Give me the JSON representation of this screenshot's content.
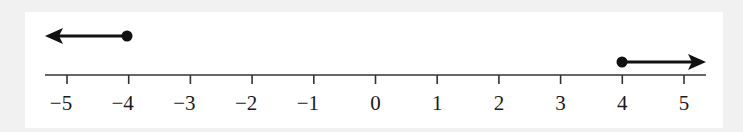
{
  "figure": {
    "type": "number-line",
    "axis": {
      "min": -5,
      "max": 5,
      "ticks": [
        {
          "value": -5,
          "label": "−5"
        },
        {
          "value": -4,
          "label": "−4"
        },
        {
          "value": -3,
          "label": "−3"
        },
        {
          "value": -2,
          "label": "−2"
        },
        {
          "value": -1,
          "label": "−1"
        },
        {
          "value": 0,
          "label": "0"
        },
        {
          "value": 1,
          "label": "1"
        },
        {
          "value": 2,
          "label": "2"
        },
        {
          "value": 3,
          "label": "3"
        },
        {
          "value": 4,
          "label": "4"
        },
        {
          "value": 5,
          "label": "5"
        }
      ]
    },
    "rays": [
      {
        "endpoint": -4,
        "direction": "left",
        "endpoint_style": "closed"
      },
      {
        "endpoint": 4,
        "direction": "right",
        "endpoint_style": "closed"
      }
    ],
    "colors": {
      "ink": "#111111",
      "axis": "#333333",
      "panel": "#ffffff",
      "background": "#f1f1f1"
    }
  }
}
